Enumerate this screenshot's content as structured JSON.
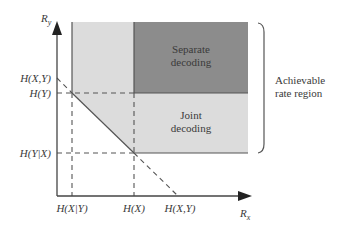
{
  "diagram": {
    "axes": {
      "y_label": "R",
      "y_label_sub": "y",
      "x_label": "R",
      "x_label_sub": "x"
    },
    "y_ticks": [
      {
        "label": "H(X,Y)"
      },
      {
        "label": "H(Y)"
      },
      {
        "label": "H(Y|X)"
      }
    ],
    "x_ticks": [
      {
        "label": "H(X|Y)"
      },
      {
        "label": "H(X)"
      },
      {
        "label": "H(X,Y)"
      }
    ],
    "regions": {
      "separate": {
        "line1": "Separate",
        "line2": "decoding",
        "color": "#8c8c8c"
      },
      "joint": {
        "line1": "Joint",
        "line2": "decoding",
        "color": "#dcdcdc"
      }
    },
    "bracket_label": {
      "line1": "Achievable",
      "line2": "rate region"
    },
    "colors": {
      "axis": "#444444",
      "light_region": "#dcdcdc",
      "dark_region": "#8c8c8c",
      "text": "#3a3a3a"
    }
  }
}
